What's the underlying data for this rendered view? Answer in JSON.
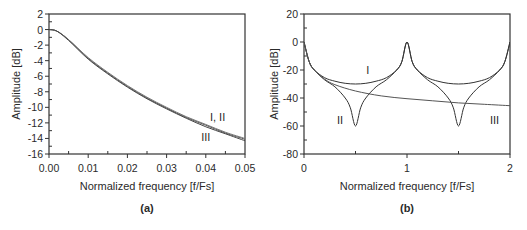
{
  "chart_data": [
    {
      "panel_label": "(a)",
      "type": "line",
      "title": "",
      "xlabel": "Normalized frequency [f/Fs]",
      "ylabel": "Amplitude [dB]",
      "xlim": [
        0.0,
        0.05
      ],
      "ylim": [
        -16,
        2
      ],
      "x_ticks": [
        "0.00",
        "0.01",
        "0.02",
        "0.03",
        "0.04",
        "0.05"
      ],
      "y_ticks": [
        "2",
        "0",
        "-2",
        "-4",
        "-6",
        "-8",
        "-10",
        "-12",
        "-14",
        "-16"
      ],
      "grid": false,
      "annotations": [
        {
          "text": "I, II",
          "x": 0.043,
          "y": -11.2
        },
        {
          "text": "III",
          "x": 0.04,
          "y": -13.8
        }
      ],
      "series": [
        {
          "name": "I",
          "x": [
            0.0,
            0.002,
            0.005,
            0.01,
            0.015,
            0.02,
            0.025,
            0.03,
            0.035,
            0.04,
            0.045,
            0.05
          ],
          "values": [
            0.0,
            -0.2,
            -1.3,
            -3.7,
            -5.6,
            -7.3,
            -8.8,
            -10.1,
            -11.3,
            -12.3,
            -13.3,
            -14.1
          ]
        },
        {
          "name": "II",
          "x": [
            0.0,
            0.002,
            0.005,
            0.01,
            0.015,
            0.02,
            0.025,
            0.03,
            0.035,
            0.04,
            0.045,
            0.05
          ],
          "values": [
            0.0,
            -0.2,
            -1.3,
            -3.6,
            -5.5,
            -7.2,
            -8.7,
            -10.0,
            -11.2,
            -12.2,
            -13.2,
            -14.0
          ]
        },
        {
          "name": "III",
          "x": [
            0.0,
            0.002,
            0.005,
            0.01,
            0.015,
            0.02,
            0.025,
            0.03,
            0.035,
            0.04,
            0.045,
            0.05
          ],
          "values": [
            0.0,
            -0.2,
            -1.4,
            -3.8,
            -5.7,
            -7.4,
            -8.9,
            -10.2,
            -11.4,
            -12.5,
            -13.4,
            -14.3
          ]
        }
      ]
    },
    {
      "panel_label": "(b)",
      "type": "line",
      "title": "",
      "xlabel": "Normalized frequency [f/Fs]",
      "ylabel": "Amplitude [dB]",
      "xlim": [
        0,
        2
      ],
      "ylim": [
        -80,
        20
      ],
      "x_ticks": [
        "0",
        "1",
        "2"
      ],
      "y_ticks": [
        "20",
        "0",
        "-20",
        "-40",
        "-60",
        "-80"
      ],
      "grid": false,
      "annotations": [
        {
          "text": "I",
          "x": 0.62,
          "y": -20
        },
        {
          "text": "II",
          "x": 0.35,
          "y": -56
        },
        {
          "text": "III",
          "x": 1.85,
          "y": -56
        }
      ],
      "series": [
        {
          "name": "I",
          "x": [
            0.0,
            0.05,
            0.1,
            0.2,
            0.3,
            0.4,
            0.5,
            0.6,
            0.7,
            0.8,
            0.9,
            0.95,
            1.0,
            1.05,
            1.1,
            1.2,
            1.3,
            1.4,
            1.5,
            1.6,
            1.7,
            1.8,
            1.9,
            1.95,
            2.0
          ],
          "values": [
            0,
            -14,
            -20,
            -25.5,
            -28,
            -29.5,
            -30,
            -29.5,
            -28,
            -25.5,
            -20,
            -14,
            0,
            -14,
            -20,
            -25.5,
            -28,
            -29.5,
            -30,
            -29.5,
            -28,
            -25.5,
            -20,
            -14,
            0
          ]
        },
        {
          "name": "II",
          "x": [
            0.0,
            0.05,
            0.1,
            0.2,
            0.3,
            0.4,
            0.45,
            0.5,
            0.55,
            0.6,
            0.7,
            0.8,
            0.9,
            0.95,
            1.0,
            1.05,
            1.1,
            1.2,
            1.3,
            1.4,
            1.45,
            1.5,
            1.55,
            1.6,
            1.7,
            1.8,
            1.9,
            1.95,
            2.0
          ],
          "values": [
            0,
            -14,
            -20,
            -27,
            -32,
            -40,
            -47,
            -60,
            -47,
            -40,
            -32,
            -27,
            -20,
            -14,
            0,
            -14,
            -20,
            -27,
            -32,
            -40,
            -47,
            -60,
            -47,
            -40,
            -32,
            -27,
            -20,
            -14,
            0
          ]
        },
        {
          "name": "III",
          "x": [
            0.0,
            0.05,
            0.1,
            0.2,
            0.3,
            0.5,
            0.75,
            1.0,
            1.25,
            1.5,
            1.75,
            2.0
          ],
          "values": [
            0,
            -14,
            -20,
            -26.5,
            -30.5,
            -35,
            -38.5,
            -40.5,
            -42,
            -43.5,
            -44.5,
            -45.5
          ]
        }
      ]
    }
  ],
  "panels": {
    "a": {
      "caption": "(a)"
    },
    "b": {
      "caption": "(b)"
    }
  }
}
